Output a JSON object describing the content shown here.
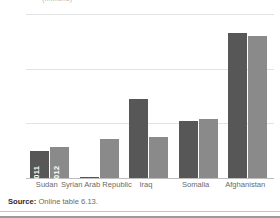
{
  "chart_data": {
    "type": "bar",
    "title": "",
    "xlabel": "",
    "ylabel": "",
    "ylim": [
      0,
      3
    ],
    "yticks": [
      0,
      1,
      2,
      3
    ],
    "ytick_labels": [
      "0",
      "1",
      "2",
      "3"
    ],
    "grid": true,
    "legend_position": "in-bar-first-group",
    "categories": [
      "Sudan",
      "Syrian Arab Republic",
      "Iraq",
      "Somalia",
      "Afghanistan"
    ],
    "series": [
      {
        "name": "2011",
        "color": "#575757",
        "values": [
          0.49,
          0.02,
          1.44,
          1.04,
          2.65
        ]
      },
      {
        "name": "2012",
        "color": "#8a8a8a",
        "values": [
          0.57,
          0.72,
          0.75,
          1.08,
          2.6
        ]
      }
    ]
  },
  "figure": {
    "title_partial": "(millions)",
    "source_label": "Source:",
    "source_text": "Online table 6.13."
  }
}
